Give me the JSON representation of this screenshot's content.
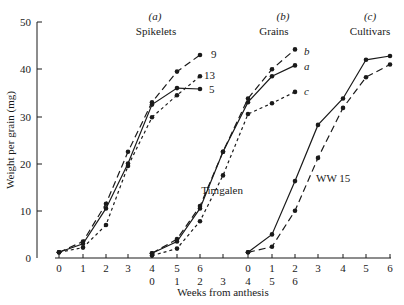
{
  "chart_data": {
    "type": "line",
    "title": "",
    "ylabel": "Weight per grain (mg)",
    "xlabel": "Weeks from anthesis",
    "ylim": [
      0,
      50
    ],
    "yticks": [
      0,
      10,
      20,
      30,
      40,
      50
    ],
    "grid": false,
    "legend_position": "inline labels at line ends",
    "panels": [
      {
        "id": "a",
        "label": "(a)",
        "title": "Spikelets",
        "x": [
          0,
          1,
          2,
          3,
          4,
          5,
          6
        ],
        "xtick_labels_row1": [
          "0",
          "1",
          "2",
          "3",
          "4",
          "5",
          "6"
        ],
        "series": [
          {
            "name": "9",
            "style": "long-dash",
            "values": [
              1.2,
              3.5,
              11.5,
              22.5,
              33.0,
              39.5,
              43.0
            ]
          },
          {
            "name": "13",
            "style": "short-dash",
            "values": [
              1.2,
              2.2,
              7.0,
              19.5,
              29.8,
              34.5,
              38.5
            ]
          },
          {
            "name": "5",
            "style": "solid",
            "values": [
              1.2,
              3.0,
              10.5,
              20.0,
              32.5,
              36.0,
              35.8
            ]
          }
        ]
      },
      {
        "id": "b",
        "label": "(b)",
        "title": "Grains",
        "x": [
          0,
          1,
          2,
          3,
          4,
          5,
          6
        ],
        "xtick_labels_row2": [
          "0",
          "1",
          "2",
          "3",
          "4",
          "5",
          "6"
        ],
        "series": [
          {
            "name": "b",
            "style": "long-dash",
            "values": [
              1.0,
              4.0,
              11.0,
              22.5,
              33.8,
              40.0,
              44.2
            ]
          },
          {
            "name": "a",
            "style": "solid",
            "values": [
              1.0,
              3.5,
              10.5,
              22.5,
              33.0,
              38.5,
              40.8
            ]
          },
          {
            "name": "c",
            "style": "short-dash",
            "values": [
              0.5,
              2.0,
              7.8,
              17.5,
              30.5,
              32.8,
              35.2
            ]
          }
        ]
      },
      {
        "id": "c",
        "label": "(c)",
        "title": "Cultivars",
        "x": [
          0,
          1,
          2,
          3,
          4,
          5,
          6
        ],
        "xtick_labels_row1": [
          "0",
          "1",
          "2",
          "3",
          "4",
          "5",
          "6"
        ],
        "series": [
          {
            "name": "Timgalen",
            "style": "solid",
            "values": [
              1.2,
              5.0,
              16.3,
              28.2,
              33.8,
              42.0,
              42.8
            ]
          },
          {
            "name": "WW 15",
            "style": "long-dash",
            "values": [
              1.2,
              2.4,
              10.0,
              21.2,
              31.8,
              38.3,
              41.0
            ]
          }
        ]
      }
    ]
  },
  "axis": {
    "ylabel": "Weight per grain (mg)",
    "xlabel": "Weeks from anthesis",
    "yticks": [
      "0",
      "10",
      "20",
      "30",
      "40",
      "50"
    ],
    "xrow1": [
      "0",
      "1",
      "2",
      "3",
      "4",
      "5",
      "6",
      "0",
      "1",
      "2",
      "3",
      "4",
      "5",
      "6"
    ],
    "xrow2": [
      "0",
      "1",
      "2",
      "3",
      "4",
      "5",
      "6"
    ]
  },
  "panels_text": {
    "a_label": "(a)",
    "a_title": "Spikelets",
    "b_label": "(b)",
    "b_title": "Grains",
    "c_label": "(c)",
    "c_title": "Cultivars"
  },
  "line_labels": {
    "s9": "9",
    "s13": "13",
    "s5": "5",
    "gb": "b",
    "ga": "a",
    "gc": "c",
    "timgalen": "Timgalen",
    "ww15": "WW 15"
  }
}
